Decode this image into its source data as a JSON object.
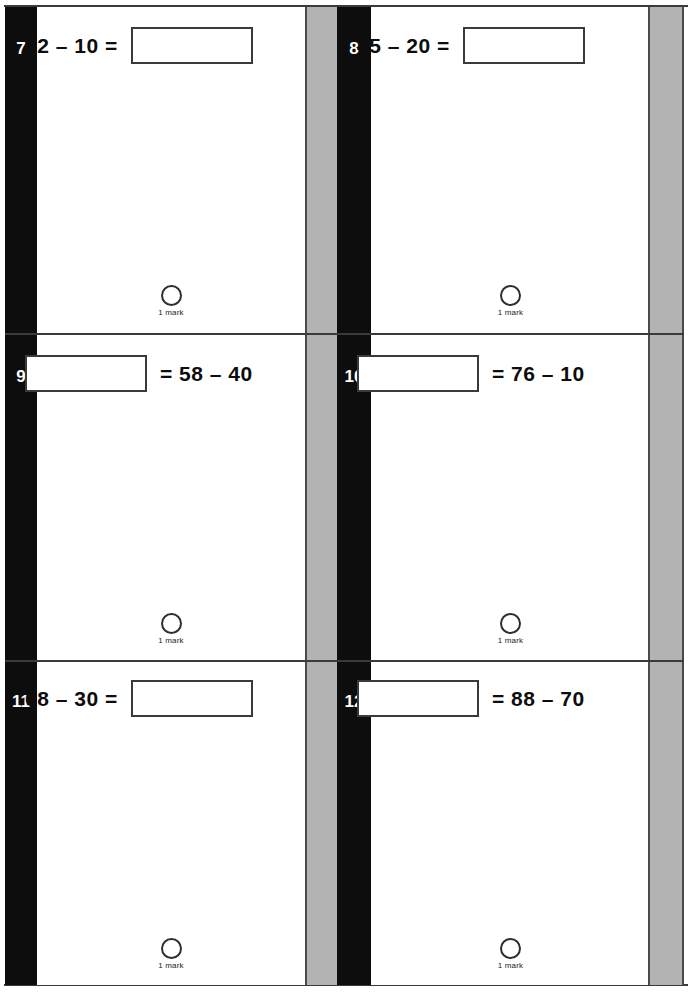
{
  "page": {
    "layout": "two-column-worksheet",
    "rule_color": "#3a3a3a",
    "spine_color": "#0d0d0d",
    "mark_strip_color": "#b3b3b3"
  },
  "columns": [
    {
      "name": "left-column",
      "questions": [
        {
          "number": "7",
          "lead_text": "32 – 10 =",
          "trail_text": "",
          "box_side": "right",
          "mark": {
            "caption": "1 mark",
            "icon": "mark-circle"
          }
        },
        {
          "number": "9",
          "lead_text": "",
          "trail_text": "= 58 – 40",
          "box_side": "left",
          "mark": {
            "caption": "1 mark",
            "icon": "mark-circle"
          }
        },
        {
          "number": "11",
          "lead_text": "68 – 30 =",
          "trail_text": "",
          "box_side": "right",
          "mark": {
            "caption": "1 mark",
            "icon": "mark-circle"
          }
        }
      ]
    },
    {
      "name": "right-column",
      "questions": [
        {
          "number": "8",
          "lead_text": "45 – 20 =",
          "trail_text": "",
          "box_side": "right",
          "mark": {
            "caption": "1 mark",
            "icon": "mark-circle"
          }
        },
        {
          "number": "10",
          "lead_text": "",
          "trail_text": "= 76 – 10",
          "box_side": "left",
          "mark": {
            "caption": "1 mark",
            "icon": "mark-circle"
          }
        },
        {
          "number": "12",
          "lead_text": "",
          "trail_text": "= 88 – 70",
          "box_side": "left",
          "mark": {
            "caption": "1 mark",
            "icon": "mark-circle"
          }
        }
      ]
    }
  ],
  "answer_fields": {
    "placeholder": "",
    "value": ""
  }
}
